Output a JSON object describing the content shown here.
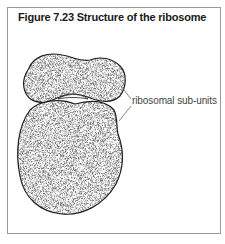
{
  "figure": {
    "title": "Figure 7.23  Structure of the ribosome",
    "labels": {
      "subunits": "ribosomal sub-units"
    },
    "colors": {
      "frame": "#9a9a9a",
      "outline": "#1e1e1e",
      "fill": "#8c8c8c",
      "text": "#444444"
    }
  }
}
